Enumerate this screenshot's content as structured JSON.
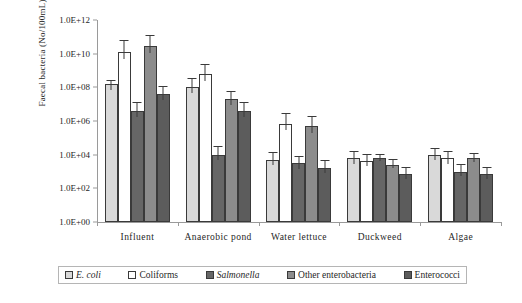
{
  "chart_data": {
    "type": "bar",
    "title": "",
    "xlabel": "",
    "ylabel": "Faecal bacteria (No/100mL)",
    "yscale": "log",
    "ylim": [
      1,
      1000000000000
    ],
    "ytick_labels": [
      "1.0E+12",
      "1.0E+10",
      "1.0E+08",
      "1.0E+06",
      "1.0E+04",
      "1.0E+02",
      "1.0E+00"
    ],
    "ytick_values": [
      1000000000000,
      10000000000,
      100000000,
      1000000,
      10000,
      100,
      1
    ],
    "grid": false,
    "legend_position": "bottom",
    "categories": [
      "Influent",
      "Anaerobic pond",
      "Water lettuce",
      "Duckweed",
      "Algae"
    ],
    "series": [
      {
        "name": "E. coli",
        "italic": true,
        "color": "#d9d9d9",
        "values": [
          150000000,
          100000000,
          5000,
          6000,
          9000
        ],
        "err_low": [
          60000000,
          40000000,
          2000,
          2500,
          4000
        ],
        "err_high": [
          250000000,
          300000000,
          12000,
          15000,
          22000
        ]
      },
      {
        "name": "Coliforms",
        "italic": false,
        "color": "#ffffff",
        "values": [
          13000000000,
          600000000,
          700000,
          4000,
          6000
        ],
        "err_low": [
          4000000000,
          200000000,
          250000,
          1800,
          2500
        ],
        "err_high": [
          60000000000,
          2000000000,
          2500000,
          9000,
          14000
        ]
      },
      {
        "name": "Salmonella",
        "italic": true,
        "color": "#666666",
        "values": [
          4000000,
          10000,
          3000,
          6000,
          1000
        ],
        "err_low": [
          1500000,
          4000,
          1300,
          3500,
          450
        ],
        "err_high": [
          12000000,
          30000,
          7000,
          10000,
          2300
        ]
      },
      {
        "name": "Other enterobacteria",
        "italic": false,
        "color": "#8c8c8c",
        "values": [
          30000000000,
          20000000,
          500000,
          2500,
          6000
        ],
        "err_low": [
          9000000000,
          8000000,
          180000,
          1400,
          3200
        ],
        "err_high": [
          110000000000,
          55000000,
          1800000,
          5000,
          11000
        ]
      },
      {
        "name": "Enterococci",
        "italic": false,
        "color": "#5c5c5c",
        "values": [
          40000000,
          4000000,
          1700,
          700,
          700
        ],
        "err_low": [
          16000000,
          1600000,
          700,
          320,
          330
        ],
        "err_high": [
          110000000,
          11000000,
          4200,
          1600,
          1700
        ]
      }
    ]
  },
  "legend": {
    "items": [
      {
        "label": "E. coli",
        "italic": true,
        "color": "#d9d9d9"
      },
      {
        "label": "Coliforms",
        "italic": false,
        "color": "#ffffff"
      },
      {
        "label": "Salmonella",
        "italic": true,
        "color": "#666666"
      },
      {
        "label": "Other enterobacteria",
        "italic": false,
        "color": "#8c8c8c"
      },
      {
        "label": "Enterococci",
        "italic": false,
        "color": "#5c5c5c"
      }
    ]
  }
}
